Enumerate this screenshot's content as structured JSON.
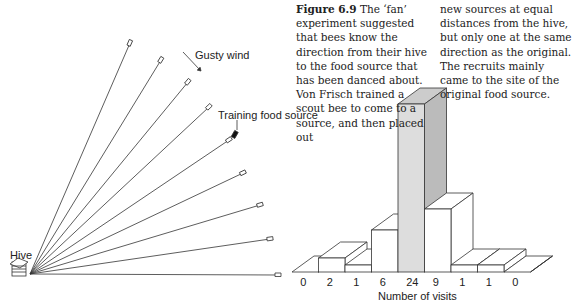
{
  "caption": {
    "figure_label": "Figure 6.9",
    "col1": "The ‘fan’ experiment suggested that bees know the direction from their hive to the food source that has been danced about. Von Frisch trained a scout bee to come to a source, and then placed out",
    "col2": "new sources at equal distances from the hive, but only one at the same direction as the original. The recruits mainly came to the site of the original food source."
  },
  "labels": {
    "hive": "Hive",
    "wind": "Gusty wind",
    "training": "Training food source",
    "xlabel": "Number of visits"
  },
  "chart_data": {
    "type": "bar",
    "categories": [
      "1",
      "2",
      "3",
      "4",
      "5",
      "6",
      "7",
      "8",
      "9"
    ],
    "values": [
      0,
      2,
      1,
      6,
      24,
      9,
      1,
      1,
      0
    ],
    "highlight_index": 4,
    "xlabel": "Number of visits",
    "ylabel": "",
    "grid": false
  }
}
